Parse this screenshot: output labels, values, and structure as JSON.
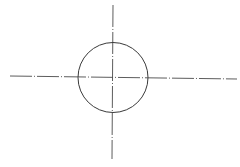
{
  "drawing": {
    "title": "",
    "colors": {
      "background": "#ffffff",
      "stroke": "#3a3a3a",
      "centerline": "#4a4a4a"
    },
    "circle": {
      "cx": 113,
      "cy": 77.5,
      "r": 35
    },
    "centerlines": {
      "horizontal": {
        "x1": 10,
        "y1": 76,
        "x2": 237,
        "y2": 79
      },
      "vertical": {
        "x1": 113,
        "y1": 5,
        "x2": 112,
        "y2": 159
      },
      "dash_pattern": "22 2 1 2"
    }
  }
}
